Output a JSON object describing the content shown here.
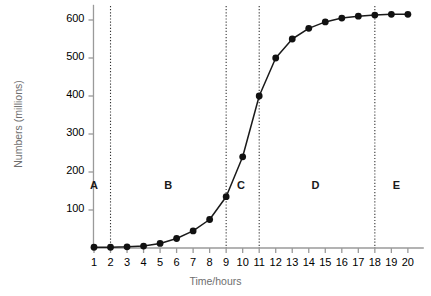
{
  "chart_data": {
    "type": "line",
    "title": "",
    "subtitle": "",
    "xlabel": "Time/hours",
    "ylabel": "Numbers (millions)",
    "xlim": [
      0,
      20.6
    ],
    "ylim": [
      0,
      640
    ],
    "grid": false,
    "legend_position": "none",
    "x_ticks": [
      1,
      2,
      3,
      4,
      5,
      6,
      7,
      8,
      9,
      10,
      11,
      12,
      13,
      14,
      15,
      16,
      17,
      18,
      19,
      20
    ],
    "x_tick_labels": [
      "1",
      "2",
      "3",
      "4",
      "5",
      "6",
      "7",
      "8",
      "9",
      "10",
      "11",
      "12",
      "13",
      "14",
      "15",
      "16",
      "17",
      "18",
      "19",
      "20"
    ],
    "y_ticks": [
      100,
      200,
      300,
      400,
      500,
      600
    ],
    "y_tick_labels": [
      "100",
      "200",
      "300",
      "400",
      "500",
      "600"
    ],
    "series": [
      {
        "name": "Numbers",
        "marker": "filled-circle",
        "x": [
          1,
          2,
          3,
          4,
          5,
          6,
          7,
          8,
          9,
          10,
          11,
          12,
          13,
          14,
          15,
          16,
          17,
          18,
          19,
          20
        ],
        "values": [
          2,
          2,
          3,
          5,
          12,
          25,
          45,
          75,
          135,
          240,
          400,
          500,
          550,
          578,
          595,
          605,
          610,
          613,
          615,
          615
        ]
      }
    ],
    "annotations": [
      {
        "name": "region-a",
        "label": "A",
        "x": 1.0,
        "y": 160,
        "range": [
          0,
          2
        ]
      },
      {
        "name": "region-b",
        "label": "B",
        "x": 5.5,
        "y": 160,
        "range": [
          2,
          9
        ]
      },
      {
        "name": "region-c",
        "label": "C",
        "x": 9.9,
        "y": 160,
        "range": [
          9,
          11
        ]
      },
      {
        "name": "region-d",
        "label": "D",
        "x": 14.4,
        "y": 160,
        "range": [
          11,
          18
        ]
      },
      {
        "name": "region-e",
        "label": "E",
        "x": 19.3,
        "y": 160,
        "range": [
          18,
          20.6
        ]
      }
    ],
    "dividers": [
      {
        "name": "divider-a-b",
        "x": 2
      },
      {
        "name": "divider-b-c",
        "x": 9
      },
      {
        "name": "divider-c-d",
        "x": 11
      },
      {
        "name": "divider-d-e",
        "x": 18
      }
    ],
    "colors": {
      "line": "#1a1a1a",
      "marker": "#111111",
      "axis": "#9a9a9a",
      "tick_text": "#6e6e6e",
      "divider": "#333333",
      "background": "#ffffff"
    }
  }
}
